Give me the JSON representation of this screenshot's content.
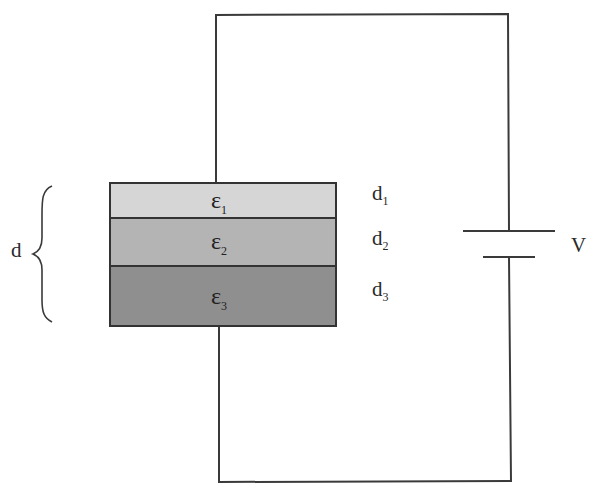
{
  "diagram": {
    "type": "circuit",
    "colors": {
      "wire": "#3a3a3a",
      "layer1": "#d6d6d6",
      "layer2": "#b4b4b4",
      "layer3": "#8f8f8f",
      "background": "#ffffff"
    },
    "capacitor": {
      "layers": [
        {
          "symbol": "ε",
          "subscript": "1",
          "thickness_label": "d",
          "thickness_sub": "1"
        },
        {
          "symbol": "ε",
          "subscript": "2",
          "thickness_label": "d",
          "thickness_sub": "2"
        },
        {
          "symbol": "ε",
          "subscript": "3",
          "thickness_label": "d",
          "thickness_sub": "3"
        }
      ],
      "total_thickness_label": "d"
    },
    "battery": {
      "label": "V"
    }
  }
}
